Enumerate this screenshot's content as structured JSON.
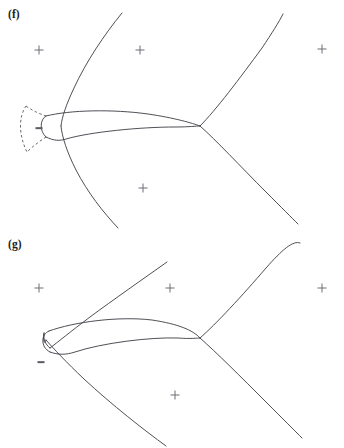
{
  "figure": {
    "kind": "caustic-singularity-diagram",
    "background_color": "#ffffff",
    "curve_color": "#3b3b43",
    "marker_color": "#6e6e76",
    "width": 344,
    "height": 448
  },
  "panels": [
    {
      "id": "f",
      "label": "(f)",
      "label_x": 8,
      "label_y": 8,
      "origin_y": 0,
      "height": 230,
      "sign_markers": [
        {
          "symbol": "+",
          "x": 39,
          "y": 50
        },
        {
          "symbol": "+",
          "x": 140,
          "y": 50
        },
        {
          "symbol": "+",
          "x": 322,
          "y": 49
        },
        {
          "symbol": "+",
          "x": 143,
          "y": 188
        },
        {
          "symbol": "−",
          "x": 39,
          "y": 128
        }
      ],
      "curves": [
        {
          "name": "outer-caustic-upper-branch",
          "style": "solid",
          "path": "M 122 13 C 104 35 86 62 74 88 C 66 105 62 117 61 126"
        },
        {
          "name": "outer-caustic-lower-branch",
          "style": "solid",
          "path": "M 61 126 C 62 137 67 152 76 170 C 88 193 103 212 118 228"
        },
        {
          "name": "inner-swallowtail-upper-edge",
          "style": "solid",
          "path": "M 46 116 C 70 110 112 109 148 114 C 175 118 192 123 200 126"
        },
        {
          "name": "inner-swallowtail-lower-edge",
          "style": "solid",
          "path": "M 46 137 C 54 141 60 141 66 139 C 90 132 140 127 175 127 C 189 127 196 126 200 126"
        },
        {
          "name": "inner-loop-left-cap",
          "style": "solid",
          "path": "M 46 116 C 40 119 39 131 46 137"
        },
        {
          "name": "junction-upper-right-branch",
          "style": "solid",
          "path": "M 200 126 C 216 110 240 78 262 48 C 272 33 279 22 283 14"
        },
        {
          "name": "junction-lower-right-branch",
          "style": "solid",
          "path": "M 200 126 C 216 140 240 166 266 192 C 282 208 292 218 298 224"
        },
        {
          "name": "virtual-caustic-upper-arc",
          "style": "dashed",
          "path": "M 26 106 C 33 111 40 114 46 116"
        },
        {
          "name": "virtual-caustic-lower-arc",
          "style": "dashed",
          "path": "M 46 137 C 40 141 33 146 27 152"
        },
        {
          "name": "virtual-caustic-outer-arc",
          "style": "dashed",
          "path": "M 26 106 C 19 116 18 134 27 152"
        }
      ]
    },
    {
      "id": "g",
      "label": "(g)",
      "label_x": 8,
      "label_y": 8,
      "origin_y": 230,
      "height": 218,
      "sign_markers": [
        {
          "symbol": "+",
          "x": 39,
          "y": 288
        },
        {
          "symbol": "+",
          "x": 170,
          "y": 288
        },
        {
          "symbol": "+",
          "x": 322,
          "y": 288
        },
        {
          "symbol": "+",
          "x": 175,
          "y": 395
        },
        {
          "symbol": "−",
          "x": 41,
          "y": 362
        }
      ],
      "curves": [
        {
          "name": "outer-caustic-upper-branch",
          "style": "solid",
          "path": "M 167 262 C 143 279 113 300 90 317 C 70 332 58 342 50 348"
        },
        {
          "name": "outer-caustic-lower-branch",
          "style": "solid",
          "path": "M 46 340 C 53 348 66 362 84 379 C 112 405 144 430 166 446"
        },
        {
          "name": "inner-swallowtail-upper-edge",
          "style": "solid",
          "path": "M 49 331 C 74 322 118 316 152 320 C 178 324 193 330 200 338"
        },
        {
          "name": "inner-swallowtail-lower-edge",
          "style": "solid",
          "path": "M 50 352 C 58 355 66 355 75 352 C 102 343 150 337 178 338 C 191 339 197 338 200 338"
        },
        {
          "name": "inner-loop-left-cap",
          "style": "solid",
          "path": "M 49 331 C 41 334 40 347 50 352"
        },
        {
          "name": "crossing-curve-upper",
          "style": "solid",
          "path": "M 50 348 C 46 344 44 339 44 334"
        },
        {
          "name": "crossing-curve-lower",
          "style": "solid",
          "path": "M 44 334 C 44 340 45 346 46 340"
        },
        {
          "name": "junction-upper-right-branch",
          "style": "solid",
          "path": "M 200 338 C 216 324 242 296 266 268 C 282 250 293 240 300 243"
        },
        {
          "name": "junction-lower-right-branch",
          "style": "solid",
          "path": "M 200 338 C 216 352 242 378 266 402 C 283 419 295 431 302 438"
        }
      ]
    }
  ]
}
